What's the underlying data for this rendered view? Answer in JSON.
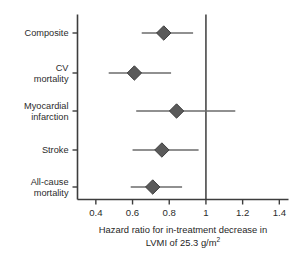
{
  "chart_data": {
    "type": "forest",
    "title": "",
    "xlabel_line1": "Hazard ratio for in-treatment decrease in",
    "xlabel_line2_pre": "LVMI of 25.3 g/m",
    "xlabel_line2_sup": "2",
    "ylabel": "",
    "xlim": [
      0.3,
      1.45
    ],
    "xticks": [
      0.4,
      0.6,
      0.8,
      1.0,
      1.2,
      1.4
    ],
    "xticklabels": [
      "0.4",
      "0.6",
      "0.8",
      "1",
      "1.2",
      "1.4"
    ],
    "reference_line": 1.0,
    "grid": false,
    "legend": "none",
    "marker": "diamond",
    "marker_color": "#5a5a5a",
    "line_color": "#6b6b6b",
    "axis_color": "#3d3d3d",
    "categories": [
      "Composite",
      "CV mortality",
      "Myocardial infarction",
      "Stroke",
      "All-cause mortality"
    ],
    "category_label_lines": [
      [
        "Composite"
      ],
      [
        "CV",
        "mortality"
      ],
      [
        "Myocardial",
        "infarction"
      ],
      [
        "Stroke"
      ],
      [
        "All-cause",
        "mortality"
      ]
    ],
    "points": [
      {
        "label": "Composite",
        "hr": 0.77,
        "ci_low": 0.65,
        "ci_high": 0.93
      },
      {
        "label": "CV mortality",
        "hr": 0.61,
        "ci_low": 0.47,
        "ci_high": 0.81
      },
      {
        "label": "Myocardial infarction",
        "hr": 0.84,
        "ci_low": 0.62,
        "ci_high": 1.16
      },
      {
        "label": "Stroke",
        "hr": 0.76,
        "ci_low": 0.6,
        "ci_high": 0.96
      },
      {
        "label": "All-cause mortality",
        "hr": 0.71,
        "ci_low": 0.59,
        "ci_high": 0.87
      }
    ]
  }
}
